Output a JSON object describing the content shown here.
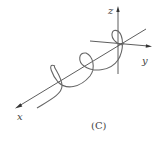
{
  "figure": {
    "caption": "(C)",
    "axes": {
      "x_label": "x",
      "y_label": "y",
      "z_label": "z"
    },
    "curve": "helix about x-axis",
    "colors": {
      "axis": "#333333",
      "curve": "#666666"
    }
  }
}
